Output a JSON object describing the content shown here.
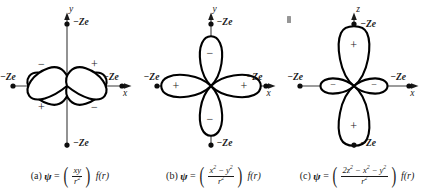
{
  "figure": {
    "background_color": "#ffffff",
    "ink_color": "#1a1a1a",
    "axis_color": "#3a3a3a"
  },
  "charge_label": "−Ze",
  "sign_plus": "+",
  "sign_minus": "−",
  "panels": [
    {
      "key": "a",
      "label": "(a)",
      "psi": "ψ",
      "equals": "=",
      "numerator": "xy",
      "denominator": "r²",
      "function": "f(r)",
      "vertical_axis": "y",
      "horizontal_axis": "x",
      "orbital_type": "dxy",
      "lobes": [
        {
          "position": "upper-left",
          "sign": "−"
        },
        {
          "position": "upper-right",
          "sign": "+"
        },
        {
          "position": "lower-left",
          "sign": "+"
        },
        {
          "position": "lower-right",
          "sign": "−"
        }
      ],
      "charges": [
        {
          "position": "top",
          "label": "−Ze"
        },
        {
          "position": "bottom",
          "label": "−Ze"
        },
        {
          "position": "left",
          "label": "−Ze"
        },
        {
          "position": "right",
          "label": "−Ze"
        }
      ]
    },
    {
      "key": "b",
      "label": "(b)",
      "psi": "ψ",
      "equals": "=",
      "numerator": "x² − y²",
      "denominator": "r²",
      "function": "f(r)",
      "vertical_axis": "y",
      "horizontal_axis": "x",
      "orbital_type": "dx2-y2",
      "lobes": [
        {
          "position": "top",
          "sign": "−"
        },
        {
          "position": "bottom",
          "sign": "−"
        },
        {
          "position": "left",
          "sign": "+"
        },
        {
          "position": "right",
          "sign": "+"
        }
      ],
      "charges": [
        {
          "position": "top",
          "label": "−Ze"
        },
        {
          "position": "bottom",
          "label": "−Ze"
        },
        {
          "position": "left",
          "label": "−Ze"
        },
        {
          "position": "right",
          "label": "−Ze"
        }
      ]
    },
    {
      "key": "c",
      "label": "(c)",
      "psi": "ψ",
      "equals": "=",
      "numerator": "2z² − x² − y²",
      "denominator": "r²",
      "function": "f(r)",
      "vertical_axis": "z",
      "horizontal_axis": "x",
      "orbital_type": "dz2",
      "lobes": [
        {
          "position": "top",
          "sign": "+"
        },
        {
          "position": "bottom",
          "sign": "+"
        },
        {
          "position": "left",
          "sign": "−"
        },
        {
          "position": "right",
          "sign": "−"
        }
      ],
      "charges": [
        {
          "position": "top",
          "label": "−Ze"
        },
        {
          "position": "bottom",
          "label": "−Ze"
        },
        {
          "position": "left",
          "label": "−Ze"
        },
        {
          "position": "right",
          "label": "−Ze"
        }
      ]
    }
  ]
}
